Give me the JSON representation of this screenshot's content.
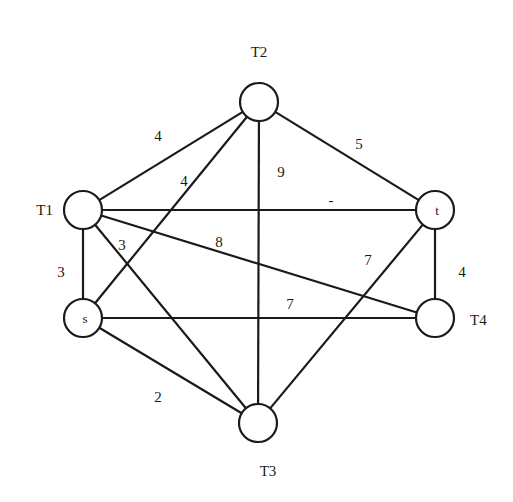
{
  "graph": {
    "nodes": [
      {
        "id": "T2",
        "x": 259,
        "y": 102,
        "label": "T2",
        "label_pos": "above",
        "inner": ""
      },
      {
        "id": "T1",
        "x": 83,
        "y": 210,
        "label": "T1",
        "label_pos": "left",
        "inner": ""
      },
      {
        "id": "t",
        "x": 435,
        "y": 210,
        "label": "",
        "label_pos": "none",
        "inner": "t"
      },
      {
        "id": "s",
        "x": 83,
        "y": 318,
        "label": "",
        "label_pos": "none",
        "inner": "s"
      },
      {
        "id": "T4",
        "x": 435,
        "y": 318,
        "label": "T4",
        "label_pos": "right",
        "inner": ""
      },
      {
        "id": "T3",
        "x": 258,
        "y": 423,
        "label": "T3",
        "label_pos": "below",
        "inner": ""
      }
    ],
    "edges": [
      {
        "from": "T1",
        "to": "T2",
        "weight": "4",
        "lx": 158,
        "ly": 138
      },
      {
        "from": "s",
        "to": "T2",
        "weight": "4",
        "lx": 184,
        "ly": 183
      },
      {
        "from": "T2",
        "to": "T3",
        "weight": "9",
        "lx": 281,
        "ly": 174
      },
      {
        "from": "T2",
        "to": "t",
        "weight": "5",
        "lx": 359,
        "ly": 146
      },
      {
        "from": "T1",
        "to": "t",
        "weight": "-",
        "lx": 331,
        "ly": 202
      },
      {
        "from": "T1",
        "to": "T4",
        "weight": "8",
        "lx": 219,
        "ly": 244
      },
      {
        "from": "T1",
        "to": "T3",
        "weight": "3",
        "lx": 122,
        "ly": 247
      },
      {
        "from": "T1",
        "to": "s",
        "weight": "3",
        "lx": 61,
        "ly": 274
      },
      {
        "from": "t",
        "to": "T4",
        "weight": "4",
        "lx": 462,
        "ly": 274
      },
      {
        "from": "t",
        "to": "T3",
        "weight": "7",
        "lx": 368,
        "ly": 262
      },
      {
        "from": "s",
        "to": "T4",
        "weight": "7",
        "lx": 290,
        "ly": 306
      },
      {
        "from": "s",
        "to": "T3",
        "weight": "2",
        "lx": 158,
        "ly": 399
      }
    ]
  }
}
